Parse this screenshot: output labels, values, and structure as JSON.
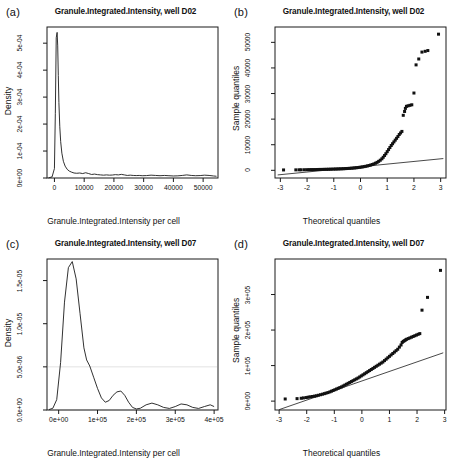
{
  "figure": {
    "panels": [
      {
        "id": "a",
        "label": "(a)",
        "title": "Granule.Integrated.Intensity, well D02",
        "type": "density"
      },
      {
        "id": "b",
        "label": "(b)",
        "title": "Granule.Integrated.Intensity, well D02",
        "type": "qq"
      },
      {
        "id": "c",
        "label": "(c)",
        "title": "Granule.Integrated.Intensity, well D07",
        "type": "density"
      },
      {
        "id": "d",
        "label": "(d)",
        "title": "Granule.Integrated.Intensity, well D07",
        "type": "qq"
      }
    ]
  },
  "chart_data": [
    {
      "type": "line",
      "panel": "a",
      "title": "Granule.Integrated.Intensity, well D02",
      "xlabel": "Granule.Integrated.Intensity per cell",
      "ylabel": "Density",
      "xlim": [
        -2500,
        55000
      ],
      "ylim": [
        0,
        0.00056
      ],
      "xticks": [
        0,
        10000,
        20000,
        30000,
        40000,
        50000
      ],
      "xticklabels": [
        "0",
        "10000",
        "20000",
        "30000",
        "40000",
        "50000"
      ],
      "yticks": [
        0,
        0.0001,
        0.0002,
        0.0003,
        0.0004,
        0.0005
      ],
      "yticklabels": [
        "0e+00",
        "1e-04",
        "2e-04",
        "3e-04",
        "4e-04",
        "5e-04"
      ],
      "grid": false,
      "legend": null,
      "x": [
        -2000,
        -800,
        0,
        300,
        600,
        900,
        1100,
        1300,
        1500,
        1800,
        2100,
        2500,
        3000,
        3600,
        4300,
        5000,
        5800,
        6600,
        7500,
        8500,
        9500,
        10500,
        11500,
        12500,
        13500,
        14500,
        15500,
        16500,
        17500,
        18500,
        19500,
        20500,
        21500,
        22500,
        23500,
        24500,
        25500,
        26500,
        27500,
        28500,
        29500,
        31000,
        32500,
        34000,
        35500,
        37000,
        38500,
        40000,
        41500,
        43000,
        44500,
        46000,
        47500,
        49000,
        50500,
        52000,
        53500,
        54500
      ],
      "y": [
        5e-07,
        4e-06,
        3.5e-05,
        0.00024,
        0.00052,
        0.00054,
        0.00049,
        0.00038,
        0.00028,
        0.00019,
        0.000135,
        9.2e-05,
        6.2e-05,
        4.4e-05,
        3.2e-05,
        2.55e-05,
        2.15e-05,
        1.85e-05,
        1.75e-05,
        1.85e-05,
        1.65e-05,
        1.95e-05,
        1.65e-05,
        1.3e-05,
        1.45e-05,
        1.25e-05,
        1.15e-05,
        1.05e-05,
        1.15e-05,
        1.05e-05,
        1.1e-05,
        1.25e-05,
        1.15e-05,
        1.35e-05,
        1.15e-05,
        9.5e-06,
        1.05e-05,
        9.5e-06,
        9e-06,
        9.5e-06,
        8.5e-06,
        9e-06,
        1.05e-05,
        9.5e-06,
        8.5e-06,
        9.5e-06,
        8.5e-06,
        7.5e-06,
        8e-06,
        9.5e-06,
        1.15e-05,
        9.5e-06,
        8.5e-06,
        9e-06,
        1.05e-05,
        9.5e-06,
        7.5e-06,
        6.5e-06
      ]
    },
    {
      "type": "scatter",
      "panel": "b",
      "title": "Granule.Integrated.Intensity, well D02",
      "xlabel": "Theoretical quantiles",
      "ylabel": "Sample quantiles",
      "xlim": [
        -3.2,
        3.2
      ],
      "ylim": [
        -3000,
        56000
      ],
      "xticks": [
        -3,
        -2,
        -1,
        0,
        1,
        2,
        3
      ],
      "xticklabels": [
        "-3",
        "-2",
        "-1",
        "0",
        "1",
        "2",
        "3"
      ],
      "yticks": [
        0,
        10000,
        20000,
        30000,
        40000,
        50000
      ],
      "yticklabels": [
        "0",
        "10000",
        "20000",
        "30000",
        "40000",
        "50000"
      ],
      "grid": false,
      "legend": null,
      "reference_line": {
        "x": [
          -3.1,
          3.1
        ],
        "y": [
          -1800,
          4600
        ]
      },
      "points_x": [
        -2.88,
        -2.42,
        -2.3,
        -2.22,
        -2.1,
        -2.0,
        -1.92,
        -1.85,
        -1.78,
        -1.7,
        -1.62,
        -1.55,
        -1.48,
        -1.4,
        -1.33,
        -1.26,
        -1.2,
        -1.13,
        -1.07,
        -1.0,
        -0.94,
        -0.88,
        -0.82,
        -0.76,
        -0.7,
        -0.64,
        -0.58,
        -0.52,
        -0.46,
        -0.4,
        -0.34,
        -0.28,
        -0.22,
        -0.16,
        -0.1,
        -0.04,
        0.02,
        0.08,
        0.14,
        0.2,
        0.26,
        0.32,
        0.38,
        0.44,
        0.5,
        0.56,
        0.62,
        0.68,
        0.74,
        0.8,
        0.85,
        0.9,
        0.95,
        1.0,
        1.05,
        1.1,
        1.15,
        1.2,
        1.25,
        1.3,
        1.35,
        1.4,
        1.45,
        1.5,
        1.55,
        1.6,
        1.65,
        1.68,
        1.72,
        1.78,
        1.85,
        1.92,
        2.0,
        2.08,
        2.18,
        2.3,
        2.42,
        2.52,
        2.92
      ],
      "points_y": [
        150,
        180,
        200,
        210,
        230,
        250,
        260,
        280,
        290,
        300,
        320,
        340,
        350,
        370,
        390,
        400,
        420,
        440,
        460,
        480,
        500,
        520,
        550,
        570,
        600,
        630,
        660,
        700,
        740,
        780,
        830,
        880,
        940,
        1000,
        1080,
        1160,
        1250,
        1350,
        1460,
        1580,
        1720,
        1880,
        2060,
        2260,
        2500,
        2780,
        3100,
        3500,
        3950,
        4500,
        5100,
        5800,
        6500,
        7300,
        8100,
        8900,
        9700,
        10400,
        11100,
        11800,
        12500,
        13200,
        14000,
        14600,
        15200,
        21500,
        23000,
        24200,
        25000,
        25200,
        25400,
        25600,
        30200,
        41200,
        43500,
        46200,
        46500,
        46800,
        53200
      ]
    },
    {
      "type": "line",
      "panel": "c",
      "title": "Granule.Integrated.Intensity, well D07",
      "xlabel": "Granule.Integrated.Intensity per cell",
      "ylabel": "Density",
      "xlim": [
        -30000,
        410000
      ],
      "ylim": [
        0,
        1.75e-05
      ],
      "xticks": [
        0,
        100000,
        200000,
        300000,
        400000
      ],
      "xticklabels": [
        "0e+00",
        "1e+05",
        "2e+05",
        "3e+05",
        "4e+05"
      ],
      "yticks": [
        0,
        5e-06,
        1e-05,
        1.5e-05
      ],
      "yticklabels": [
        "0.0e+00",
        "5.0e-06",
        "1.0e-05",
        "1.5e-05"
      ],
      "grid": true,
      "gridlines_y": [
        0,
        5e-06
      ],
      "legend": null,
      "x": [
        -25000,
        -15000,
        -5000,
        5000,
        15000,
        25000,
        35000,
        45000,
        55000,
        65000,
        72000,
        80000,
        90000,
        100000,
        110000,
        120000,
        130000,
        140000,
        150000,
        160000,
        170000,
        180000,
        190000,
        200000,
        210000,
        225000,
        240000,
        255000,
        270000,
        285000,
        300000,
        315000,
        330000,
        345000,
        360000,
        375000,
        390000,
        400000
      ],
      "y": [
        5e-08,
        2e-07,
        1.2e-06,
        5.5e-06,
        1.25e-05,
        1.65e-05,
        1.72e-05,
        1.52e-05,
        1.12e-05,
        7.2e-06,
        5.8e-06,
        5.1e-06,
        3.8e-06,
        2.5e-06,
        1.4e-06,
        9e-07,
        1.1e-06,
        1.7e-06,
        2.1e-06,
        2.2e-06,
        1.7e-06,
        9e-07,
        3e-07,
        1.2e-07,
        2e-07,
        6e-07,
        8e-07,
        6e-07,
        3e-07,
        1.8e-07,
        4e-07,
        7e-07,
        6e-07,
        3e-07,
        1.8e-07,
        4e-07,
        6e-07,
        4e-07
      ]
    },
    {
      "type": "scatter",
      "panel": "d",
      "title": "Granule.Integrated.Intensity, well D07",
      "xlabel": "Theoretical quantiles",
      "ylabel": "Sample quantiles",
      "xlim": [
        -3.15,
        3.05
      ],
      "ylim": [
        -25000,
        400000
      ],
      "xticks": [
        -3,
        -2,
        -1,
        0,
        1,
        2,
        3
      ],
      "xticklabels": [
        "-3",
        "-2",
        "-1",
        "0",
        "1",
        "2",
        "3"
      ],
      "yticks": [
        0,
        100000,
        200000,
        300000
      ],
      "yticklabels": [
        "0e+00",
        "1e+05",
        "2e+05",
        "3e+05"
      ],
      "grid": false,
      "legend": null,
      "reference_line": {
        "x": [
          -3.0,
          2.95
        ],
        "y": [
          -24000,
          136000
        ]
      },
      "points_x": [
        -2.78,
        -2.35,
        -2.2,
        -2.12,
        -2.02,
        -1.95,
        -1.88,
        -1.8,
        -1.72,
        -1.65,
        -1.58,
        -1.5,
        -1.43,
        -1.36,
        -1.3,
        -1.23,
        -1.16,
        -1.1,
        -1.04,
        -0.98,
        -0.92,
        -0.86,
        -0.8,
        -0.74,
        -0.68,
        -0.62,
        -0.56,
        -0.5,
        -0.44,
        -0.38,
        -0.32,
        -0.26,
        -0.2,
        -0.14,
        -0.08,
        -0.02,
        0.04,
        0.1,
        0.16,
        0.22,
        0.28,
        0.34,
        0.4,
        0.46,
        0.52,
        0.58,
        0.64,
        0.7,
        0.76,
        0.82,
        0.88,
        0.94,
        1.0,
        1.06,
        1.12,
        1.18,
        1.24,
        1.3,
        1.36,
        1.42,
        1.46,
        1.5,
        1.54,
        1.58,
        1.62,
        1.68,
        1.74,
        1.8,
        1.86,
        1.92,
        1.98,
        2.04,
        2.1,
        2.18,
        2.38,
        2.85
      ],
      "points_y": [
        6000,
        7000,
        8000,
        9000,
        10000,
        11000,
        12000,
        13000,
        14000,
        15000,
        16500,
        18000,
        19500,
        21000,
        22500,
        24000,
        26000,
        28000,
        30000,
        32000,
        34000,
        36000,
        38000,
        40000,
        42500,
        45000,
        47500,
        50000,
        52500,
        55000,
        57500,
        60000,
        62500,
        65000,
        68000,
        71000,
        74000,
        77000,
        80000,
        83000,
        86000,
        89000,
        92000,
        95000,
        98000,
        101000,
        104000,
        107000,
        110000,
        114000,
        118000,
        122000,
        126000,
        130000,
        134000,
        138000,
        142000,
        146000,
        152000,
        158000,
        165000,
        168000,
        170000,
        172000,
        174000,
        176000,
        178000,
        180000,
        182000,
        184000,
        186000,
        188000,
        190000,
        256000,
        292000,
        368000
      ]
    }
  ]
}
